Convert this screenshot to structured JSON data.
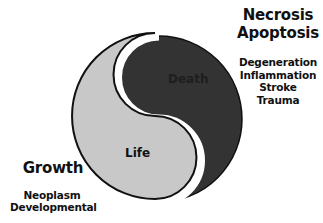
{
  "diagram": {
    "type": "yin-yang",
    "regions": [
      {
        "id": "life",
        "label": "Life",
        "color": "#c8c8c8"
      },
      {
        "id": "death",
        "label": "Death",
        "color": "#333333"
      }
    ],
    "outline_color": "#111111",
    "gap_color": "#ffffff"
  },
  "death_side": {
    "titles": [
      "Necrosis",
      "Apoptosis"
    ],
    "causes": [
      "Degeneration",
      "Inflammation",
      "Stroke",
      "Trauma"
    ]
  },
  "life_side": {
    "title": "Growth",
    "causes": [
      "Neoplasm",
      "Developmental"
    ]
  }
}
